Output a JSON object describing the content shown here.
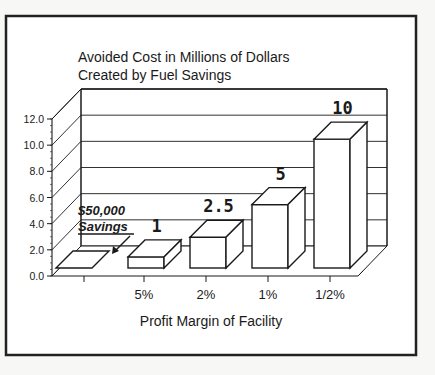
{
  "chart_data": {
    "type": "bar",
    "style": "3d-bar",
    "title": [
      "Avoided Cost in Millions of Dollars",
      "Created by Fuel Savings"
    ],
    "xlabel": "Profit Margin of Facility",
    "ylabel": "",
    "categories": [
      "",
      "5%",
      "2%",
      "1%",
      "1/2%"
    ],
    "values": [
      0.05,
      1,
      2.5,
      5,
      10
    ],
    "data_labels": [
      "",
      "1",
      "2.5",
      "5",
      "10"
    ],
    "yticks": [
      "0.0",
      "2.0",
      "4.0",
      "6.0",
      "8.0",
      "10.0",
      "12.0"
    ],
    "ylim": [
      0,
      12
    ],
    "grid": true,
    "annotation": {
      "line1": "$50,000",
      "line2": "Savings",
      "target_category_index": 0
    },
    "colors": {
      "ink": "#1a1a1a",
      "bar_fill": "#ffffff",
      "background": "#ffffff"
    }
  }
}
